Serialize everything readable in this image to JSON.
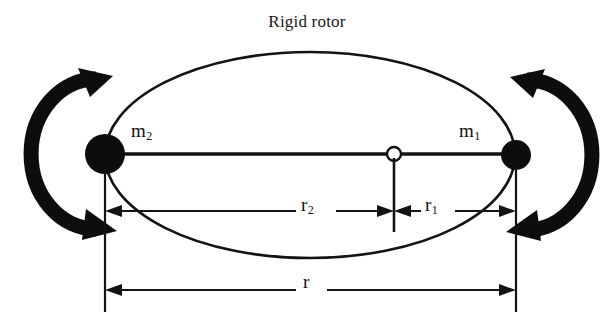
{
  "title": "Rigid rotor",
  "diagram": {
    "type": "physics-schematic",
    "background_color": "#ffffff",
    "stroke_color": "#111111",
    "labels": {
      "mass_left": "m",
      "mass_left_sub": "2",
      "mass_right": "m",
      "mass_right_sub": "1",
      "dim_left": "r",
      "dim_left_sub": "2",
      "dim_right": "r",
      "dim_right_sub": "1",
      "dim_total": "r"
    },
    "elements": {
      "orbit_ellipse": "ellipse",
      "mass_left_marker": "filled-circle",
      "mass_right_marker": "filled-circle",
      "centre_of_mass_marker": "hollow-circle",
      "rod": "horizontal-line",
      "rotation_arrow_left": "curved-double-arrow-ccw",
      "rotation_arrow_right": "curved-double-arrow-cw",
      "dimension_line_r2": "arrow-line",
      "dimension_line_r1": "arrow-line",
      "dimension_line_r": "double-arrow-line",
      "extension_lines": "vertical-witness-lines"
    },
    "geometry": {
      "ellipse_center_x": 310,
      "ellipse_center_y": 155,
      "ellipse_rx": 205,
      "ellipse_ry": 103,
      "mass_left_x": 105,
      "mass_left_y": 154,
      "mass_left_radius": 20,
      "mass_right_x": 516,
      "mass_right_y": 155,
      "mass_right_radius": 15,
      "centre_of_mass_x": 394,
      "centre_of_mass_y": 154,
      "centre_of_mass_radius": 7,
      "dim_row_upper_y": 211,
      "dim_row_lower_y": 290
    }
  }
}
